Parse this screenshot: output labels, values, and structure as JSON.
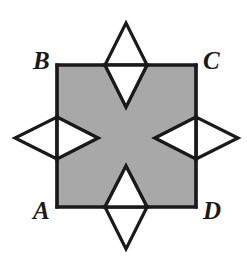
{
  "figure": {
    "kind": "geometry-diagram",
    "background_color": "#ffffff",
    "shaded_fill": "#a8a8a8",
    "stroke_color": "#1a1a1a",
    "stroke_width": 3.2,
    "square": {
      "name": "ABCD",
      "left": 57,
      "top": 65,
      "right": 196,
      "bottom": 207,
      "side_length": 139
    },
    "labels": [
      {
        "id": "B",
        "text": "B",
        "corner": "top-left",
        "x": 33,
        "y": 48
      },
      {
        "id": "C",
        "text": "C",
        "corner": "top-right",
        "x": 203,
        "y": 48
      },
      {
        "id": "A",
        "text": "A",
        "corner": "bottom-left",
        "x": 33,
        "y": 198
      },
      {
        "id": "D",
        "text": "D",
        "corner": "bottom-right",
        "x": 203,
        "y": 198
      }
    ],
    "rhombi": [
      {
        "id": "top",
        "side": "top-edge",
        "center_x": 126,
        "center_y": 65,
        "half_width": 21,
        "half_height": 42,
        "outer_points": "126,23 147,65 126,65 105,65",
        "inner_points": "105,65 147,65 126,107"
      },
      {
        "id": "bottom",
        "side": "bottom-edge",
        "center_x": 126,
        "center_y": 207,
        "half_width": 21,
        "half_height": 42,
        "outer_points": "126,249 147,207 126,207 105,207",
        "inner_points": "105,207 147,207 126,166"
      },
      {
        "id": "left",
        "side": "left-edge",
        "center_x": 57,
        "center_y": 138,
        "half_width": 42,
        "half_height": 21,
        "outer_points": "15,138 57,117 57,138 57,159",
        "inner_points": "57,117 57,159 98,138"
      },
      {
        "id": "right",
        "side": "right-edge",
        "center_x": 196,
        "center_y": 138,
        "half_width": 42,
        "half_height": 21,
        "outer_points": "238,138 196,117 196,138 196,159",
        "inner_points": "196,117 196,159 155,138"
      }
    ]
  }
}
